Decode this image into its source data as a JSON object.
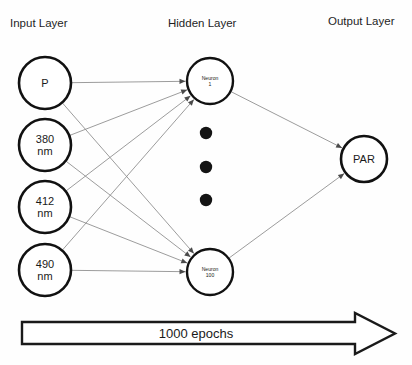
{
  "diagram": {
    "layer_labels": [
      {
        "id": "input",
        "text": "Input Layer",
        "x": 10,
        "y": 27
      },
      {
        "id": "hidden",
        "text": "Hidden Layer",
        "x": 168,
        "y": 27
      },
      {
        "id": "output",
        "text": "Output Layer",
        "x": 328,
        "y": 25
      }
    ],
    "input_nodes": [
      {
        "id": "p",
        "line1": "P",
        "line2": "",
        "cx": 45,
        "cy": 83,
        "r": 26
      },
      {
        "id": "nm380",
        "line1": "380",
        "line2": "nm",
        "cx": 45,
        "cy": 145,
        "r": 26
      },
      {
        "id": "nm412",
        "line1": "412",
        "line2": "nm",
        "cx": 45,
        "cy": 207,
        "r": 26
      },
      {
        "id": "nm490",
        "line1": "490",
        "line2": "nm",
        "cx": 45,
        "cy": 270,
        "r": 26
      }
    ],
    "hidden_nodes": [
      {
        "id": "neuron1",
        "line1": "Neuron",
        "line2": "1",
        "cx": 210,
        "cy": 81,
        "r": 23
      },
      {
        "id": "neuron100",
        "line1": "Neuron",
        "line2": "100",
        "cx": 210,
        "cy": 272,
        "r": 23
      }
    ],
    "hidden_ellipsis": [
      {
        "cx": 206,
        "cy": 133,
        "r": 6.2
      },
      {
        "cx": 206,
        "cy": 167,
        "r": 6.2
      },
      {
        "cx": 206,
        "cy": 200,
        "r": 6.2
      }
    ],
    "output_nodes": [
      {
        "id": "par",
        "line1": "PAR",
        "line2": "",
        "cx": 364,
        "cy": 159,
        "r": 23
      }
    ],
    "edges": [
      {
        "from": "p",
        "to": "neuron1"
      },
      {
        "from": "p",
        "to": "neuron100"
      },
      {
        "from": "nm380",
        "to": "neuron1"
      },
      {
        "from": "nm380",
        "to": "neuron100"
      },
      {
        "from": "nm412",
        "to": "neuron1"
      },
      {
        "from": "nm412",
        "to": "neuron100"
      },
      {
        "from": "nm490",
        "to": "neuron1"
      },
      {
        "from": "nm490",
        "to": "neuron100"
      },
      {
        "from": "neuron1",
        "to": "par"
      },
      {
        "from": "neuron100",
        "to": "par"
      }
    ],
    "epochs_arrow": {
      "label": "1000 epochs",
      "label_x": 196,
      "label_y": 338,
      "body_left": 22,
      "body_top": 322,
      "body_bottom": 344,
      "shaft_right": 355,
      "head_top": 313,
      "head_bottom": 354,
      "tip_x": 395
    },
    "colors": {
      "stroke": "#111111",
      "edge": "#8a8a8a",
      "text": "#1a1a1a",
      "background": "#fefefe",
      "dot": "#141414"
    }
  }
}
